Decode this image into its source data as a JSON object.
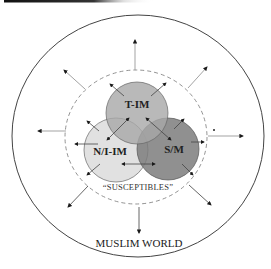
{
  "diagram": {
    "groups": [
      {
        "id": "t-im",
        "label": "T-IM",
        "fill": "#a9a9a9"
      },
      {
        "id": "n-i-im",
        "label": "N/I-IM",
        "fill": "#d9d9d9"
      },
      {
        "id": "s-m",
        "label": "S/M",
        "fill": "#7a7a7a"
      }
    ],
    "susceptibles_label": "“SUSCEPTIBLES”",
    "outer_label": "MUSLIM WORLD",
    "colors": {
      "outer_ring": "#444444",
      "dashed_ring": "#777777",
      "arrow": "#555555",
      "top_rule": "#222222"
    }
  }
}
